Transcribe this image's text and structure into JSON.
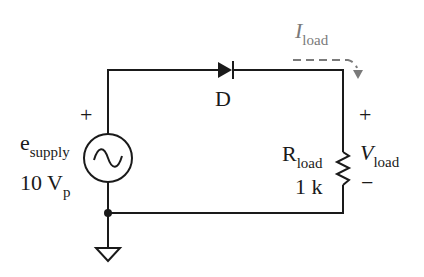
{
  "diagram": {
    "type": "circuit-schematic",
    "source": {
      "name_main": "e",
      "name_sub": "supply",
      "value_main": "10 V",
      "value_sub": "p",
      "polarity_plus": "+"
    },
    "diode": {
      "label": "D"
    },
    "load": {
      "name_main": "R",
      "name_sub": "load",
      "value": "1 k"
    },
    "voltage": {
      "plus": "+",
      "name_main": "V",
      "name_sub": "load",
      "minus": "−"
    },
    "current": {
      "name_main": "I",
      "name_sub": "load"
    },
    "colors": {
      "wire": "#1a1a1a",
      "current_arrow": "#7a7a7a"
    }
  }
}
